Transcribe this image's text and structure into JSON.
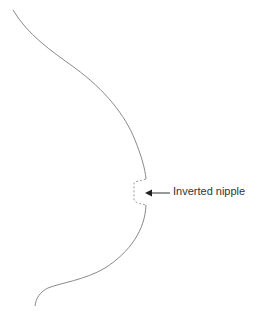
{
  "diagram": {
    "type": "anatomical-line-drawing",
    "annotation": {
      "label": "Inverted nipple",
      "arrow_direction": "left"
    },
    "colors": {
      "outline": "#8a8a8a",
      "dashed": "#9a9a9a",
      "text": "#333333",
      "background": "#ffffff"
    }
  }
}
